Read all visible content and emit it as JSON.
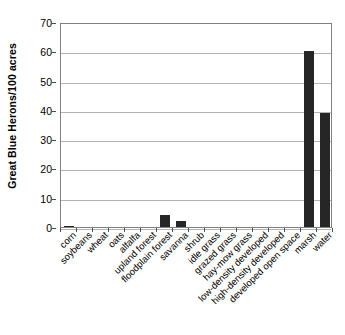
{
  "chart_data": {
    "type": "bar",
    "title": "",
    "subtitle": "",
    "xlabel": "",
    "ylabel": "Great Blue Herons/100 acres",
    "ylim": [
      0,
      70
    ],
    "ytick_step": 10,
    "ytick_labels": [
      "0",
      "10",
      "20",
      "30",
      "40",
      "50",
      "60",
      "70"
    ],
    "ytick_values": [
      0,
      10,
      20,
      30,
      40,
      50,
      60,
      70
    ],
    "grid": true,
    "grid_axis": "y",
    "legend": false,
    "legend_position": "none",
    "bar_color": "#262626",
    "categories": [
      "corn",
      "soybeans",
      "wheat",
      "oats",
      "alfalfa",
      "upland forest",
      "floodplain forest",
      "savanna",
      "shrub",
      "idle grass",
      "grazed grass",
      "hay-mow grass",
      "low-density developed",
      "high-density developed",
      "developed open space",
      "marsh",
      "water"
    ],
    "values": [
      0.5,
      0,
      0,
      0,
      0,
      0,
      4,
      2,
      0,
      0,
      0,
      0,
      0,
      0,
      0,
      60,
      39
    ]
  },
  "colors": {
    "bar": "#262626",
    "gridline": "#b3b3b3",
    "axis_border": "#808080",
    "text": "#000000",
    "background": "#ffffff"
  }
}
